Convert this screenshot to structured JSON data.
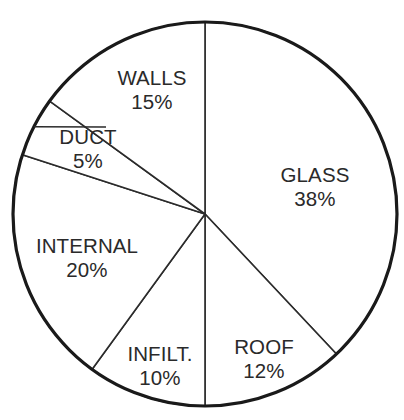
{
  "chart_data": {
    "type": "pie",
    "title": "",
    "subtitle": "",
    "xlabel": "",
    "ylabel": "",
    "legend": "none",
    "grid": false,
    "unit": "%",
    "total": 100,
    "start_angle_deg": 0,
    "direction": "clockwise",
    "categories": [
      "GLASS",
      "ROOF",
      "INFILT.",
      "INTERNAL",
      "DUCT",
      "WALLS"
    ],
    "values": [
      38,
      12,
      10,
      20,
      5,
      15
    ],
    "value_labels": [
      "38%",
      "12%",
      "10%",
      "20%",
      "5%",
      "15%"
    ],
    "slices": [
      {
        "name": "GLASS",
        "value": 38,
        "value_label": "38%",
        "start_deg": 0,
        "end_deg": 136.8,
        "label_x": 315,
        "label_y": 187,
        "leader": false
      },
      {
        "name": "ROOF",
        "value": 12,
        "value_label": "12%",
        "start_deg": 136.8,
        "end_deg": 180,
        "label_x": 264,
        "label_y": 359,
        "leader": false
      },
      {
        "name": "INFILT.",
        "value": 10,
        "value_label": "10%",
        "start_deg": 180,
        "end_deg": 216,
        "label_x": 160,
        "label_y": 366,
        "leader": false
      },
      {
        "name": "INTERNAL",
        "value": 20,
        "value_label": "20%",
        "start_deg": 216,
        "end_deg": 288,
        "label_x": 87,
        "label_y": 258,
        "leader": false
      },
      {
        "name": "DUCT",
        "value": 5,
        "value_label": "5%",
        "start_deg": 288,
        "end_deg": 306,
        "label_x": 88,
        "label_y": 149,
        "leader": true
      },
      {
        "name": "WALLS",
        "value": 15,
        "value_label": "15%",
        "start_deg": 306,
        "end_deg": 360,
        "label_x": 152,
        "label_y": 90,
        "leader": false
      }
    ],
    "colors": {
      "slice_fill": "#ffffff",
      "slice_stroke": "#2b2b2b",
      "outline_stroke": "#1a1a1a",
      "text": "#2a2a2a",
      "background": "#ffffff"
    },
    "geometry": {
      "center_x": 205,
      "center_y": 214,
      "radius": 192
    }
  }
}
